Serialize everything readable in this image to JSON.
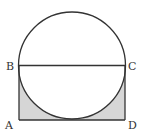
{
  "diagram": {
    "type": "geometry",
    "points": {
      "A": {
        "label": "A",
        "x": 19,
        "y": 120
      },
      "B": {
        "label": "B",
        "x": 19,
        "y": 65
      },
      "C": {
        "label": "C",
        "x": 125,
        "y": 65
      },
      "D": {
        "label": "D",
        "x": 125,
        "y": 120
      }
    },
    "circle": {
      "cx": 72,
      "cy": 65.5,
      "r": 53.5
    },
    "colors": {
      "stroke": "#333333",
      "shade": "#d6d6d6",
      "background": "#ffffff"
    }
  }
}
